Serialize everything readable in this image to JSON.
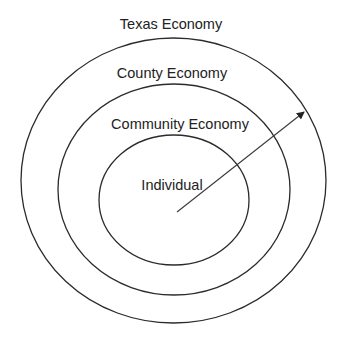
{
  "diagram": {
    "type": "concentric-circles",
    "colors": {
      "stroke": "#2b2b2b",
      "text": "#222222",
      "background": "#ffffff"
    },
    "rings": [
      {
        "id": "texas",
        "label": "Texas Economy",
        "cx": 173.5,
        "cy": 180.5,
        "rx": 152.5,
        "ry": 142.5,
        "label_x": 171,
        "label_y": 29
      },
      {
        "id": "county",
        "label": "County Economy",
        "cx": 174,
        "cy": 189.5,
        "rx": 116,
        "ry": 105.5,
        "label_x": 172,
        "label_y": 78
      },
      {
        "id": "community",
        "label": "Community Economy",
        "cx": 174,
        "cy": 200,
        "rx": 75,
        "ry": 65,
        "label_x": 180,
        "label_y": 129
      }
    ],
    "center_label": {
      "label": "Individual",
      "x": 172,
      "y": 190
    },
    "arrow": {
      "x1": 177,
      "y1": 212,
      "x2": 304,
      "y2": 112
    }
  }
}
